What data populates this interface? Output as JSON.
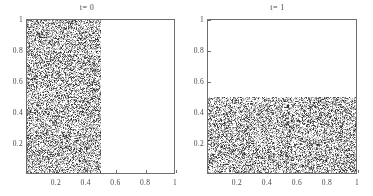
{
  "figure": {
    "background_color": "#ffffff",
    "frame_color": "#6d6d6d",
    "text_color": "#4a4a4a",
    "noise_color": "#808080"
  },
  "chart_data": [
    {
      "type": "heatmap",
      "title": "t= 0",
      "xlabel": "",
      "ylabel": "",
      "xlim": [
        0,
        1
      ],
      "ylim": [
        0,
        1
      ],
      "grid": false,
      "legend": "none",
      "xticks": [
        0.2,
        0.4,
        0.6,
        0.8,
        1
      ],
      "xtick_labels": [
        "0.2",
        "0.4",
        "0.6",
        "0.8",
        "1"
      ],
      "yticks": [
        0.2,
        0.4,
        0.6,
        0.8,
        1
      ],
      "ytick_labels": [
        "0.2",
        "0.4",
        "0.6",
        "0.8",
        "1"
      ],
      "annotation": "random grayscale noise filling x in [0, 0.5], y in [0, 1]; remainder white",
      "filled_region": {
        "x0": 0.0,
        "x1": 0.5,
        "y0": 0.0,
        "y1": 1.0
      },
      "empty_region": {
        "x0": 0.5,
        "x1": 1.0,
        "y0": 0.0,
        "y1": 1.0
      },
      "fill_fraction": 0.5
    },
    {
      "type": "heatmap",
      "title": "t= 1",
      "xlabel": "",
      "ylabel": "",
      "xlim": [
        0,
        1
      ],
      "ylim": [
        0,
        1
      ],
      "grid": false,
      "legend": "none",
      "xticks": [
        0.2,
        0.4,
        0.6,
        0.8,
        1
      ],
      "xtick_labels": [
        "0.2",
        "0.4",
        "0.6",
        "0.8",
        "1"
      ],
      "yticks": [
        0.2,
        0.4,
        0.6,
        0.8,
        1
      ],
      "ytick_labels": [
        "0.2",
        "0.4",
        "0.6",
        "0.8",
        "1"
      ],
      "annotation": "random grayscale noise filling x in [0, 1], y in [0, 0.5]; remainder white",
      "filled_region": {
        "x0": 0.0,
        "x1": 1.0,
        "y0": 0.0,
        "y1": 0.5
      },
      "empty_region": {
        "x0": 0.0,
        "x1": 1.0,
        "y0": 0.5,
        "y1": 1.0
      },
      "fill_fraction": 0.5
    }
  ],
  "panels": [
    {
      "name": "left",
      "title": "t= 0",
      "y_labels": [
        "1",
        "0.8",
        "0.6",
        "0.4",
        "0.2"
      ],
      "y_positions": [
        1,
        0.8,
        0.6,
        0.4,
        0.2
      ],
      "x_labels": [
        "0.2",
        "0.4",
        "0.6",
        "0.8",
        "1"
      ],
      "x_positions": [
        0.2,
        0.4,
        0.6,
        0.8,
        1
      ]
    },
    {
      "name": "right",
      "title": "t= 1",
      "y_labels": [
        "1",
        "0.8",
        "0.6",
        "0.4",
        "0.2"
      ],
      "y_positions": [
        1,
        0.8,
        0.6,
        0.4,
        0.2
      ],
      "x_labels": [
        "0.2",
        "0.4",
        "0.6",
        "0.8",
        "1"
      ],
      "x_positions": [
        0.2,
        0.4,
        0.6,
        0.8,
        1
      ]
    }
  ]
}
